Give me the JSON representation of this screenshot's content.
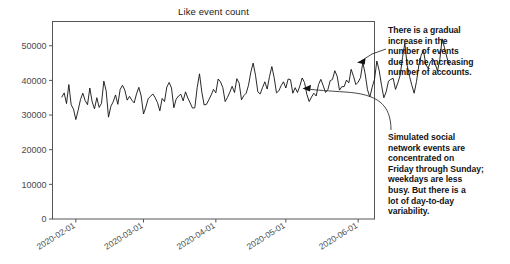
{
  "chart_data": {
    "type": "line",
    "title": "Like event count",
    "xlabel": "",
    "ylabel": "",
    "grid": false,
    "legend": null,
    "xlim": [
      "2020-01-22",
      "2020-06-08"
    ],
    "ylim": [
      0,
      57000
    ],
    "yticks": [
      0,
      10000,
      20000,
      30000,
      40000,
      50000
    ],
    "ytick_labels": [
      "0",
      "10000",
      "20000",
      "30000",
      "40000",
      "50000"
    ],
    "xticks": [
      "2020-02-01",
      "2020-03-01",
      "2020-04-01",
      "2020-05-01",
      "2020-06-01"
    ],
    "xtick_labels": [
      "2020-02-01",
      "2020-03-01",
      "2020-04-01",
      "2020-05-01",
      "2020-06-01"
    ],
    "line_color": "#111111",
    "series": [
      {
        "name": "Like event count",
        "x_start": "2020-01-26",
        "x_step_days": 1,
        "values": [
          35200,
          36400,
          33300,
          38800,
          33000,
          31700,
          28700,
          31400,
          34500,
          36300,
          34200,
          33000,
          37800,
          33800,
          31800,
          35000,
          32200,
          33400,
          39800,
          37000,
          29400,
          32500,
          33800,
          35800,
          33100,
          37400,
          38600,
          37200,
          34300,
          35400,
          34300,
          33500,
          36100,
          38000,
          35500,
          30300,
          32300,
          34700,
          35400,
          36100,
          35000,
          33600,
          31200,
          34800,
          33900,
          38100,
          39400,
          37800,
          32100,
          34600,
          35500,
          36000,
          34100,
          36700,
          34900,
          33500,
          32000,
          32100,
          37900,
          41900,
          36600,
          32900,
          33100,
          34400,
          35800,
          37400,
          36400,
          40400,
          39600,
          37900,
          33900,
          35100,
          36600,
          38300,
          36500,
          40500,
          39200,
          34400,
          35600,
          36300,
          38600,
          42400,
          45000,
          41500,
          36700,
          36100,
          37900,
          39600,
          37500,
          41100,
          44000,
          40800,
          36400,
          37000,
          38500,
          39600,
          37800,
          40400,
          40200,
          36300,
          37900,
          36500,
          38400,
          40700,
          39400,
          36000,
          33900,
          35200,
          36300,
          35500,
          38800,
          40300,
          38500,
          36500,
          37300,
          39900,
          40300,
          42800,
          41200,
          37200,
          38200,
          38200,
          40100,
          39300,
          43200,
          41200,
          38800,
          39500,
          40800,
          45200,
          41900,
          37300,
          35200,
          38000,
          40300,
          45600,
          42900,
          38600,
          35000,
          36700,
          39800,
          40300,
          40600,
          37400,
          39300,
          41500,
          46600,
          50700,
          44300,
          41200,
          38600,
          36300,
          39700,
          44400,
          47300,
          48600,
          44500,
          43500,
          45400,
          46200,
          44800,
          42700,
          46100,
          52000,
          49400,
          46700,
          44400
        ]
      }
    ],
    "annotations": [
      {
        "id": "growth-note",
        "text": "There is a gradual increase in the number of events due to the increasing number of accounts.",
        "lines": [
          "There is a gradual",
          "increase in the",
          "number of events",
          "due to the increasing",
          "number of accounts."
        ],
        "arrow_target": {
          "x": 357,
          "y": 62
        }
      },
      {
        "id": "weekly-pattern-note",
        "text": "Simulated social network events are concentrated on Friday through Sunday; weekdays are less busy. But there is a lot of day-to-day variability.",
        "lines": [
          "Simulated social",
          "network events are",
          "concentrated on",
          "Friday through Sunday;",
          "weekdays are less",
          "busy. But there is a",
          "lot of day-to-day",
          "variability."
        ],
        "arrow_target": {
          "x": 303,
          "y": 89
        }
      }
    ]
  }
}
